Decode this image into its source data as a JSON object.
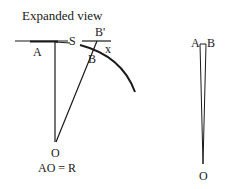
{
  "diagram": {
    "title": "Expanded view",
    "left_figure": {
      "labels": {
        "A": "A",
        "S": "S",
        "B_prime": "B'",
        "B": "B",
        "x": "x",
        "O": "O"
      },
      "equation": "AO = R"
    },
    "right_figure": {
      "labels": {
        "A": "A",
        "B": "B",
        "O": "O"
      }
    },
    "colors": {
      "stroke": "#1a1a1a",
      "background": "#ffffff"
    }
  }
}
